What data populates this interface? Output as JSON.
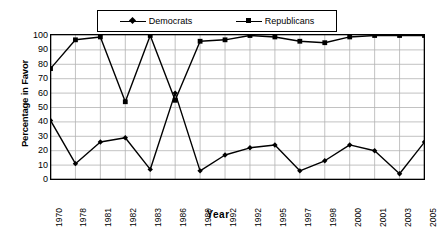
{
  "chart_data": {
    "type": "line",
    "title": "",
    "xlabel": "Year",
    "ylabel": "Percentage in Favor",
    "ylim": [
      0,
      100
    ],
    "ytick_step": 10,
    "yticks": [
      100,
      90,
      80,
      70,
      60,
      50,
      40,
      30,
      20,
      10,
      0
    ],
    "grid": true,
    "legend_position": "top-center",
    "categories": [
      "1970",
      "1978",
      "1981",
      "1982",
      "1983",
      "1986",
      "1989",
      "1992",
      "1992",
      "1995",
      "1997",
      "1998",
      "2000",
      "2001",
      "2003",
      "2005"
    ],
    "series": [
      {
        "name": "Democrats",
        "marker": "diamond",
        "color": "#000000",
        "values": [
          41,
          11,
          26,
          29,
          7,
          60,
          6,
          17,
          22,
          24,
          6,
          13,
          24,
          20,
          4,
          26
        ]
      },
      {
        "name": "Republicans",
        "marker": "square",
        "color": "#000000",
        "values": [
          77,
          97,
          99,
          54,
          100,
          55,
          96,
          97,
          100,
          99,
          96,
          95,
          99,
          100,
          100,
          100
        ]
      }
    ]
  },
  "legend": {
    "entries": [
      {
        "label": "Democrats",
        "marker": "diamond"
      },
      {
        "label": "Republicans",
        "marker": "square"
      }
    ]
  },
  "axes": {
    "x_title": "Year",
    "y_title": "Percentage in Favor"
  }
}
